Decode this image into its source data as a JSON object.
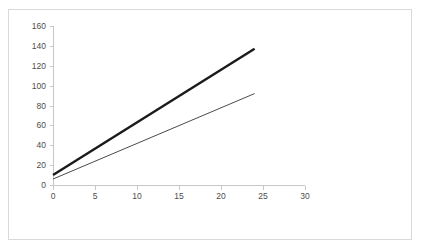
{
  "chart_data": {
    "type": "line",
    "title": "",
    "subtitle": "",
    "xlabel": "",
    "ylabel": "",
    "xlim": [
      0,
      30
    ],
    "ylim": [
      0,
      160
    ],
    "x_ticks": [
      0,
      5,
      10,
      15,
      20,
      25,
      30
    ],
    "y_ticks": [
      0,
      20,
      40,
      60,
      80,
      100,
      120,
      140,
      160
    ],
    "x_tick_labels": [
      "0",
      "5",
      "10",
      "15",
      "20",
      "25",
      "30"
    ],
    "y_tick_labels": [
      "0",
      "20",
      "40",
      "60",
      "80",
      "100",
      "120",
      "140",
      "160"
    ],
    "grid": false,
    "legend": false,
    "legend_position": "none",
    "series": [
      {
        "name": "upper-line",
        "color": "#1a1a1a",
        "line_width": 2.4,
        "x": [
          0,
          24
        ],
        "values": [
          10,
          137
        ]
      },
      {
        "name": "lower-line",
        "color": "#4a4a4a",
        "line_width": 1,
        "x": [
          0,
          24
        ],
        "values": [
          6,
          92
        ]
      }
    ]
  },
  "frame": {
    "border_color": "#d9d9d9",
    "background": "#ffffff"
  },
  "axis": {
    "line_color": "#c8c8c8",
    "label_color": "#4d4d4d"
  }
}
